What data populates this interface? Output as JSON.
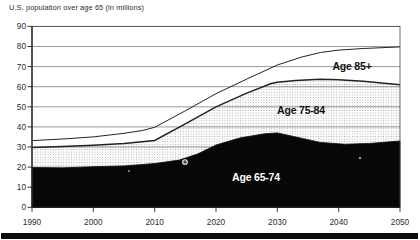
{
  "colors": {
    "ink": "#222222",
    "text": "#2e2e2e",
    "area_black": "#070707",
    "grid": "#6e6e6e",
    "stipple_dot": "#9a9a9a",
    "stipple_bg": "#fcfcfc",
    "label_on_black": "#ffffff",
    "scan_bar": "#0d0d0d"
  },
  "chart_data": {
    "type": "area",
    "stacked": true,
    "title": "U.S. population over age 65 (in millions)",
    "xlabel": "",
    "ylabel": "",
    "xlim": [
      1990,
      2050
    ],
    "ylim": [
      0,
      90
    ],
    "grid": "horizontal",
    "legend": "inline-labels",
    "categories": [
      1990,
      2000,
      2010,
      2020,
      2030,
      2040,
      2050
    ],
    "series": [
      {
        "name": "Age 65-74",
        "fill": "black",
        "values": [
          20,
          20,
          22,
          31,
          37,
          31.5,
          33
        ]
      },
      {
        "name": "Age 75-84",
        "fill": "stipple",
        "values": [
          10,
          11,
          11.5,
          19,
          25.5,
          32,
          28
        ]
      },
      {
        "name": "Age 85+",
        "fill": "white",
        "values": [
          3,
          4,
          6.5,
          6.5,
          8.5,
          14.5,
          19
        ]
      }
    ],
    "cumulative_outlines": {
      "age_65_74_top": [
        [
          1990,
          19.8
        ],
        [
          1995,
          19.6
        ],
        [
          2000,
          20.2
        ],
        [
          2005,
          20.6
        ],
        [
          2010,
          21.8
        ],
        [
          2014,
          23.5
        ],
        [
          2017,
          26.5
        ],
        [
          2020,
          31
        ],
        [
          2024,
          34.6
        ],
        [
          2028,
          36.6
        ],
        [
          2030,
          37
        ],
        [
          2033,
          35
        ],
        [
          2037,
          32.3
        ],
        [
          2041,
          31.4
        ],
        [
          2045,
          31.8
        ],
        [
          2050,
          33
        ]
      ],
      "age_75_84_top": [
        [
          1990,
          29.8
        ],
        [
          1995,
          30.3
        ],
        [
          2000,
          30.9
        ],
        [
          2005,
          31.7
        ],
        [
          2010,
          33.3
        ],
        [
          2015,
          41.5
        ],
        [
          2020,
          50
        ],
        [
          2025,
          56.8
        ],
        [
          2029,
          61.6
        ],
        [
          2030,
          62.2
        ],
        [
          2033,
          63.1
        ],
        [
          2037,
          63.7
        ],
        [
          2040,
          63.5
        ],
        [
          2044,
          62.7
        ],
        [
          2050,
          61
        ]
      ],
      "age_85_plus_top": [
        [
          1990,
          33.2
        ],
        [
          1995,
          34
        ],
        [
          2000,
          35
        ],
        [
          2005,
          36.8
        ],
        [
          2008,
          38.2
        ],
        [
          2010,
          39.8
        ],
        [
          2015,
          48
        ],
        [
          2020,
          56.5
        ],
        [
          2025,
          63.8
        ],
        [
          2030,
          70.8
        ],
        [
          2034,
          74.8
        ],
        [
          2037,
          77
        ],
        [
          2040,
          78.2
        ],
        [
          2044,
          79
        ],
        [
          2050,
          79.8
        ]
      ]
    },
    "y_ticks": [
      {
        "v": 0,
        "label": "0"
      },
      {
        "v": 10,
        "label": "10"
      },
      {
        "v": 20,
        "label": "20"
      },
      {
        "v": 30,
        "label": "30"
      },
      {
        "v": 40,
        "label": "40"
      },
      {
        "v": 50,
        "label": "50"
      },
      {
        "v": 60,
        "label": "60"
      },
      {
        "v": 70,
        "label": "70"
      },
      {
        "v": 80,
        "label": "80"
      },
      {
        "v": 90,
        "label": "90"
      }
    ],
    "x_ticks": [
      {
        "v": 1990,
        "label": "1990"
      },
      {
        "v": 2000,
        "label": "2000"
      },
      {
        "v": 2010,
        "label": "2010"
      },
      {
        "v": 2020,
        "label": "2020"
      },
      {
        "v": 2030,
        "label": "2030"
      },
      {
        "v": 2040,
        "label": "2040"
      },
      {
        "v": 2050,
        "label": "2050"
      }
    ],
    "inline_labels": [
      {
        "text": "Age 85+",
        "x": 352,
        "y": 70,
        "on": "white-band"
      },
      {
        "text": "Age 75-84",
        "x": 301,
        "y": 114,
        "on": "stipple-band"
      },
      {
        "text": "Age 65-74",
        "x": 256,
        "y": 181,
        "on": "black-band"
      }
    ],
    "scan_artifacts": [
      {
        "x": 129,
        "y": 171,
        "r": 1.0,
        "kind": "dot"
      },
      {
        "x": 185,
        "y": 162,
        "r": 2.3,
        "kind": "ring"
      },
      {
        "x": 360,
        "y": 158,
        "r": 1.2,
        "kind": "dot"
      }
    ]
  }
}
